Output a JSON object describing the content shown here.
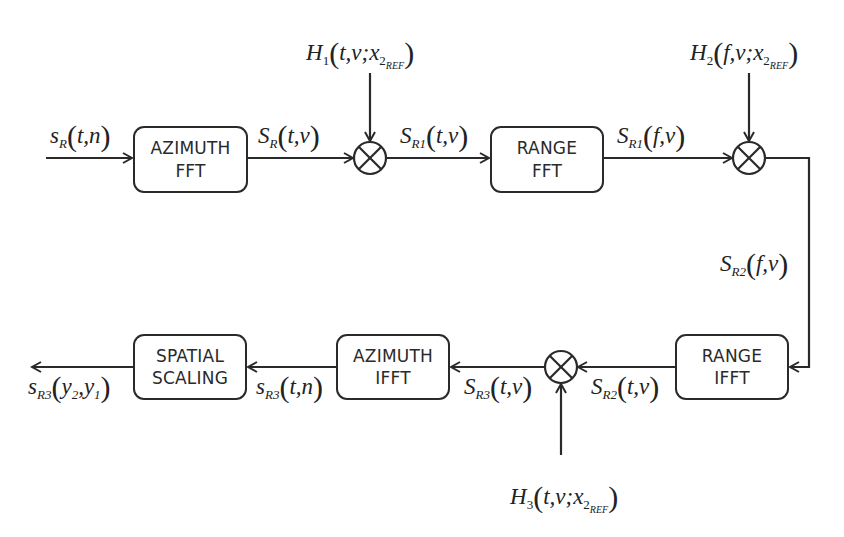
{
  "diagram": {
    "type": "signal-processing-block-diagram",
    "blocks": [
      {
        "id": "azimuth_fft",
        "line1": "AZIMUTH",
        "line2": "FFT"
      },
      {
        "id": "range_fft",
        "line1": "RANGE",
        "line2": "FFT"
      },
      {
        "id": "range_ifft",
        "line1": "RANGE",
        "line2": "IFFT"
      },
      {
        "id": "azimuth_ifft",
        "line1": "AZIMUTH",
        "line2": "IFFT"
      },
      {
        "id": "spatial_scaling",
        "line1": "SPATIAL",
        "line2": "SCALING"
      }
    ],
    "multipliers": [
      {
        "id": "mult1",
        "symbol": "⊗"
      },
      {
        "id": "mult2",
        "symbol": "⊗"
      },
      {
        "id": "mult3",
        "symbol": "⊗"
      }
    ],
    "signals": {
      "input": {
        "base": "s",
        "sub": "R",
        "args": "t,n"
      },
      "after_azimuth_fft": {
        "base": "S",
        "sub": "R",
        "args": "t,ν"
      },
      "after_mult1": {
        "base": "S",
        "sub": "R1",
        "args": "t,ν"
      },
      "after_range_fft": {
        "base": "S",
        "sub": "R1",
        "args": "f,ν"
      },
      "after_mult2": {
        "base": "S",
        "sub": "R2",
        "args": "f,ν"
      },
      "after_range_ifft": {
        "base": "S",
        "sub": "R2",
        "args": "t,ν"
      },
      "after_mult3": {
        "base": "S",
        "sub": "R3",
        "args": "t,ν"
      },
      "after_azimuth_ifft": {
        "base": "s",
        "sub": "R3",
        "args": "t,n"
      },
      "output": {
        "base": "s",
        "sub": "R3",
        "args": "y",
        "args_full": "y2,y1"
      }
    },
    "filters": {
      "h1": {
        "base": "H",
        "sub": "1",
        "args": "t,ν;",
        "ref_var": "x",
        "ref_sub": "2",
        "ref_subsub": "REF"
      },
      "h2": {
        "base": "H",
        "sub": "2",
        "args": "f,ν;",
        "ref_var": "x",
        "ref_sub": "2",
        "ref_subsub": "REF"
      },
      "h3": {
        "base": "H",
        "sub": "3",
        "args": "t,ν;",
        "ref_var": "x",
        "ref_sub": "2",
        "ref_subsub": "REF"
      }
    },
    "output_args": {
      "a": "y",
      "a_sub": "2",
      "sep": ",",
      "b": "y",
      "b_sub": "1"
    },
    "colors": {
      "stroke": "#2a2a2a",
      "background": "#ffffff"
    }
  }
}
